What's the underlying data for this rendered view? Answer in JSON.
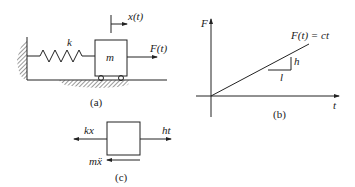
{
  "panel_a": {
    "caption": "(a)",
    "spring_label": "k",
    "mass_label": "m",
    "displacement_label": "x(t)",
    "force_label": "F(t)"
  },
  "panel_b": {
    "caption": "(b)",
    "y_axis_label": "F",
    "x_axis_label": "t",
    "line_label": "F(t) = ct",
    "slope_rise_label": "h",
    "slope_run_label": "l"
  },
  "panel_c": {
    "caption": "(c)",
    "left_force_label": "kx",
    "right_force_label": "ht",
    "inertia_label": "mẍ"
  },
  "colors": {
    "ink": "#222222",
    "background": "#ffffff",
    "hatch": "#555555"
  }
}
